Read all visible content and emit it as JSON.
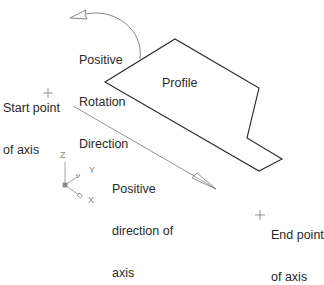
{
  "diagram": {
    "labels": {
      "rotation": [
        "Positive",
        "Rotation",
        "Direction"
      ],
      "profile": "Profile",
      "start_point": [
        "Start point",
        "of axis"
      ],
      "positive_direction": [
        "Positive",
        "direction of",
        "axis"
      ],
      "end_point": [
        "End point",
        "of axis"
      ]
    },
    "ucs_icon": {
      "z": "Z",
      "y": "Y",
      "x": "X"
    },
    "colors": {
      "profile_stroke": "#2b2b2b",
      "axis_stroke": "#777777",
      "text": "#2a2a2a",
      "ucs": "#8a8a8a"
    }
  }
}
